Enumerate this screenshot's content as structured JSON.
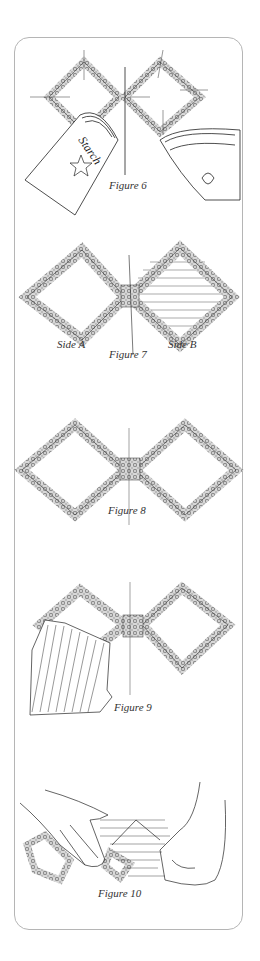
{
  "figures": [
    {
      "id": "figure-6",
      "caption": "Figure 6",
      "labels": {
        "can": "Starch"
      },
      "description": "Starch spray can and iron pressing two diamond-shaped lace frames pinned to a center line"
    },
    {
      "id": "figure-7",
      "caption": "Figure 7",
      "labels": {
        "left": "Side A",
        "right": "Side B"
      },
      "description": "Two diamond frames joined at center; Side A open, Side B with striped fabric"
    },
    {
      "id": "figure-8",
      "caption": "Figure 8",
      "description": "Two open diamond lace frames joined at center line"
    },
    {
      "id": "figure-9",
      "caption": "Figure 9",
      "description": "Striped fabric placed under left diamond frame"
    },
    {
      "id": "figure-10",
      "caption": "Figure 10",
      "description": "Hands folding striped fabric over the lace frames"
    }
  ],
  "colors": {
    "border": "#b5b5b5",
    "ink": "#333333",
    "lace": "#8a8a8a"
  }
}
